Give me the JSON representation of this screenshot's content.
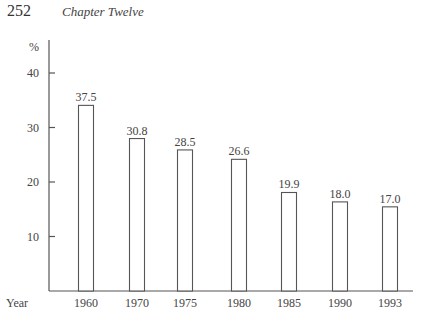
{
  "page": {
    "page_number": "252",
    "running_head": "Chapter Twelve"
  },
  "chart_data": {
    "type": "bar",
    "title": "",
    "xlabel": "Year",
    "ylabel": "%",
    "categories": [
      "1960",
      "1970",
      "1975",
      "1980",
      "1985",
      "1990",
      "1993"
    ],
    "values": [
      37.5,
      30.8,
      28.5,
      26.6,
      19.9,
      18.0,
      17.0
    ],
    "value_labels": [
      "37.5",
      "30.8",
      "28.5",
      "26.6",
      "19.9",
      "18.0",
      "17.0"
    ],
    "yticks": [
      10,
      20,
      30,
      40
    ],
    "ytick_labels": [
      "10",
      "20",
      "30",
      "40"
    ],
    "ylim": [
      0,
      45
    ],
    "grid": false,
    "legend": "none",
    "bar_style": "outlined"
  }
}
